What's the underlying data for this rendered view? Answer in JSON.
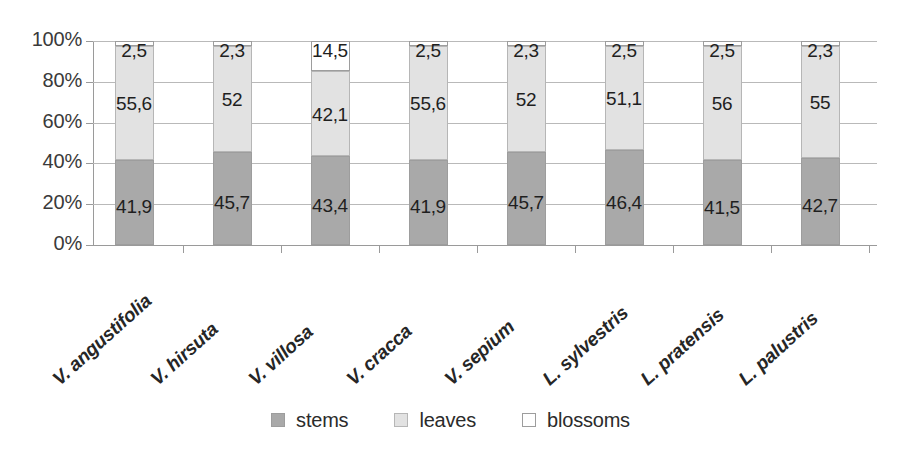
{
  "chart_data": {
    "type": "bar",
    "subtype": "stacked-100-percent",
    "title": "",
    "subtitle": "",
    "xlabel": "",
    "ylabel": "",
    "ylim": [
      0,
      100
    ],
    "y_tick_labels": [
      "100%",
      "80%",
      "60%",
      "40%",
      "20%",
      "0%"
    ],
    "y_tick_values": [
      100,
      80,
      60,
      40,
      20,
      0
    ],
    "grid": true,
    "legend_position": "bottom",
    "decimal_separator": ",",
    "categories": [
      "V. angustifolia",
      "V. hirsuta",
      "V. villosa",
      "V. cracca",
      "V. sepium",
      "L. sylvestris",
      "L. pratensis",
      "L. palustris"
    ],
    "series": [
      {
        "name": "stems",
        "color": "#a9a9a9",
        "values": [
          41.9,
          45.7,
          43.4,
          41.9,
          45.7,
          46.4,
          41.5,
          42.7
        ],
        "labels": [
          "41,9",
          "45,7",
          "43,4",
          "41,9",
          "45,7",
          "46,4",
          "41,5",
          "42,7"
        ]
      },
      {
        "name": "leaves",
        "color": "#e2e2e2",
        "values": [
          55.6,
          52,
          42.1,
          55.6,
          52,
          51.1,
          56,
          55
        ],
        "labels": [
          "55,6",
          "52",
          "42,1",
          "55,6",
          "52",
          "51,1",
          "56",
          "55"
        ]
      },
      {
        "name": "blossoms",
        "color": "#ffffff",
        "values": [
          2.5,
          2.3,
          14.5,
          2.5,
          2.3,
          2.5,
          2.5,
          2.3
        ],
        "labels": [
          "2,5",
          "2,3",
          "14,5",
          "2,5",
          "2,3",
          "2,5",
          "2,5",
          "2,3"
        ]
      }
    ]
  },
  "legend": {
    "items": [
      {
        "label": "stems",
        "swatch": "stems-swatch"
      },
      {
        "label": "leaves",
        "swatch": "leaves-swatch"
      },
      {
        "label": "blossoms",
        "swatch": "blossoms-swatch"
      }
    ]
  },
  "colors": {
    "stems": "#a9a9a9",
    "leaves": "#e2e2e2",
    "blossoms": "#ffffff",
    "grid": "#b9b9b9",
    "axis": "#9a9a9a",
    "text": "#2b2b2b"
  }
}
